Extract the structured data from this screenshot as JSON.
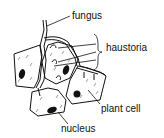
{
  "diagram": {
    "labels": {
      "fungus": "fungus",
      "haustoria": "haustoria",
      "plant_cell": "plant cell",
      "nucleus": "nucleus"
    },
    "colors": {
      "ink": "#111111",
      "background": "#ffffff"
    }
  }
}
